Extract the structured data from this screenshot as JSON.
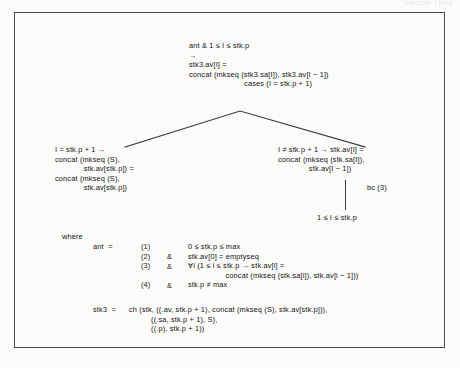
{
  "document": {
    "kind": "scanned-figure",
    "faint_header": "PROOF TREE",
    "frame_color": "#4a4a4a",
    "text_color": "#141414",
    "page_color": "#fbfbfa"
  },
  "proof_tree": {
    "root": {
      "name": "root-node",
      "lines": [
        "ant & 1 ≤ I ≤ stk.p",
        "→",
        "stk3.av[I] =",
        "concat (mkseq (stk3.sa[I]), stk3.av[I − 1])",
        "                         cases (I = stk.p + 1)"
      ]
    },
    "left_branch": {
      "name": "left-branch",
      "lines": [
        "I = stk.p + 1 →",
        "concat (mkseq (S),",
        "             stk.av[stk.p]) =",
        "concat (mkseq (S),",
        "             stk.av[stk.p])"
      ]
    },
    "right_branch": {
      "name": "right-branch",
      "lines": [
        "I ≠ stk.p + 1 → stk.av[I] =",
        "concat (mkseq (stk.sa[I]),",
        "              stk.av[I − 1])"
      ],
      "rule_label": "bc (3)",
      "leaf": "1 ≤ I ≤ stk.p"
    }
  },
  "where_block": {
    "keyword": "where",
    "ant_label": "ant  =",
    "conditions": [
      {
        "number": "(1)",
        "connector": "",
        "body": "0 ≤ stk.p ≤ max"
      },
      {
        "number": "(2)",
        "connector": "&",
        "body": "stk.av[0] = emptyseq"
      },
      {
        "number": "(3)",
        "connector": "&",
        "body": "∀i (1 ≤ i ≤ stk.p → stk.av[i] ="
      },
      {
        "number": "",
        "connector": "",
        "body": "                 concat (mkseq (stk.sa[i]), stk.av[i − 1]))"
      },
      {
        "number": "(4)",
        "connector": "&",
        "body": "stk.p ≠ max"
      }
    ],
    "numbers_text": "(1)\n(2)\n(3)\n\n(4)",
    "amps_text": "&\n&\n\n&",
    "bodies_text": "0 ≤ stk.p ≤ max\nstk.av[0] = emptyseq\n∀i (1 ≤ i ≤ stk.p → stk.av[i] =\n                 concat (mkseq (stk.sa[i]), stk.av[i − 1]))\nstk.p ≠ max"
  },
  "stk3_definition": {
    "label": "stk3  =",
    "lines": [
      "ch (stk, ((.av, stk.p + 1), concat (mkseq (S), stk.av[stk.p])),",
      "          ((.sa, stk.p + 1), S),",
      "          ((.p), stk.p + 1))"
    ],
    "body_text": "ch (stk, ((.av, stk.p + 1), concat (mkseq (S), stk.av[stk.p])),\n          ((.sa, stk.p + 1), S),\n          ((.p), stk.p + 1))"
  }
}
